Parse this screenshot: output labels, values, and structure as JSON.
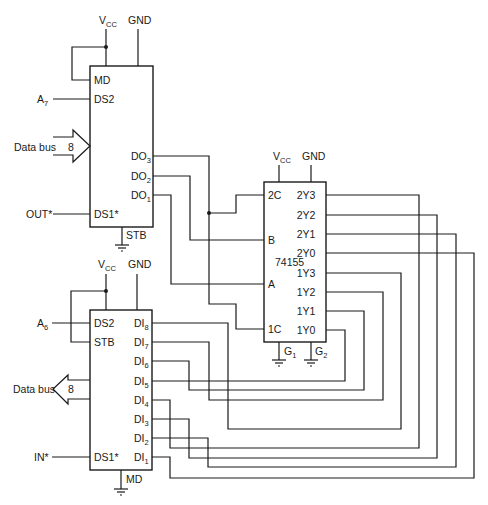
{
  "diagram": {
    "type": "circuit-schematic",
    "colors": {
      "line": "#1a1a1a",
      "background": "#ffffff"
    },
    "output_port": {
      "supply": {
        "vcc": "V",
        "vcc_sub": "CC",
        "gnd": "GND"
      },
      "pins_left": {
        "md": "MD",
        "ds2": "DS2",
        "ds1": "DS1*"
      },
      "pins_right": [
        {
          "name": "DO",
          "sub": "3"
        },
        {
          "name": "DO",
          "sub": "2"
        },
        {
          "name": "DO",
          "sub": "1"
        }
      ],
      "bottom_pin": "STB",
      "inputs": {
        "a7": "A",
        "a7_sub": "7",
        "out": "OUT*"
      },
      "data_bus": {
        "label": "Data bus",
        "width": "8"
      }
    },
    "decoder": {
      "part": "74155",
      "supply": {
        "vcc": "V",
        "vcc_sub": "CC",
        "gnd": "GND"
      },
      "pins_left": [
        "2C",
        "B",
        "A",
        "1C"
      ],
      "pins_right": [
        "2Y3",
        "2Y2",
        "2Y1",
        "2Y0",
        "1Y3",
        "1Y2",
        "1Y1",
        "1Y0"
      ],
      "grounds": [
        {
          "name": "G",
          "sub": "1"
        },
        {
          "name": "G",
          "sub": "2"
        }
      ]
    },
    "input_port": {
      "supply": {
        "vcc": "V",
        "vcc_sub": "CC",
        "gnd": "GND"
      },
      "pins_left": {
        "ds2": "DS2",
        "stb": "STB",
        "ds1": "DS1*"
      },
      "pins_right": [
        {
          "name": "DI",
          "sub": "8"
        },
        {
          "name": "DI",
          "sub": "7"
        },
        {
          "name": "DI",
          "sub": "6"
        },
        {
          "name": "DI",
          "sub": "5"
        },
        {
          "name": "DI",
          "sub": "4"
        },
        {
          "name": "DI",
          "sub": "3"
        },
        {
          "name": "DI",
          "sub": "2"
        },
        {
          "name": "DI",
          "sub": "1"
        }
      ],
      "bottom_pin": "MD",
      "inputs": {
        "a6": "A",
        "a6_sub": "6",
        "in": "IN*"
      },
      "data_bus": {
        "label": "Data bus",
        "width": "8"
      }
    }
  }
}
